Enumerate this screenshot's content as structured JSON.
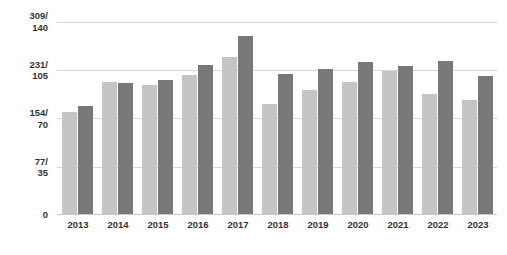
{
  "chart_data": {
    "type": "bar",
    "title": "",
    "subtitle": "",
    "xlabel": "",
    "ylabel": "",
    "grid": true,
    "legend": "none",
    "categories": [
      "2013",
      "2014",
      "2015",
      "2016",
      "2017",
      "2018",
      "2019",
      "2020",
      "2021",
      "2022",
      "2023"
    ],
    "y_tick_labels": [
      "309/\n140",
      "231/\n105",
      "154/\n70",
      "77/\n35",
      "0"
    ],
    "y_ticks_primary": [
      309,
      231,
      154,
      77,
      0
    ],
    "y_ticks_secondary": [
      140,
      105,
      70,
      35,
      0
    ],
    "ylim_primary": [
      0,
      309
    ],
    "ylim_secondary": [
      0,
      140
    ],
    "series": [
      {
        "name": "light-series",
        "color": "#c4c4c4",
        "axis": "primary",
        "values": [
          162,
          210,
          205,
          221,
          250,
          175,
          197,
          210,
          228,
          191,
          181
        ]
      },
      {
        "name": "dark-series",
        "color": "#787878",
        "axis": "secondary",
        "values": [
          78,
          95,
          97,
          108,
          129,
          101,
          105,
          110,
          107,
          111,
          100
        ]
      }
    ]
  },
  "colors": {
    "light_bar": "#c4c4c4",
    "dark_bar": "#787878",
    "gridline": "#d8d8d8",
    "baseline": "#c8c8c8",
    "text": "#333333",
    "background": "#ffffff"
  },
  "y_axis": {
    "ticks": [
      {
        "label": "309/\n140",
        "primary": 309,
        "secondary": 140
      },
      {
        "label": "231/\n105",
        "primary": 231,
        "secondary": 105
      },
      {
        "label": "154/\n70",
        "primary": 154,
        "secondary": 70
      },
      {
        "label": "77/\n35",
        "primary": 77,
        "secondary": 35
      },
      {
        "label": "0",
        "primary": 0,
        "secondary": 0
      }
    ]
  },
  "x_axis": {
    "ticks": [
      "2013",
      "2014",
      "2015",
      "2016",
      "2017",
      "2018",
      "2019",
      "2020",
      "2021",
      "2022",
      "2023"
    ]
  }
}
